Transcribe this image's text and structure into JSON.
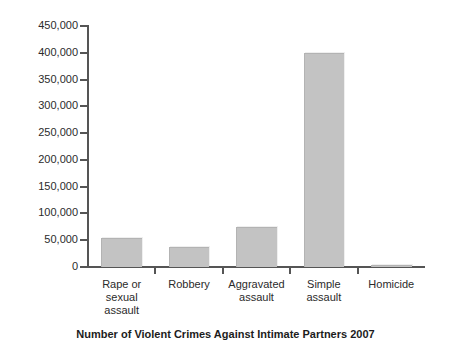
{
  "caption": "Number of Violent Crimes Against Intimate Partners 2007",
  "chart_data": {
    "type": "bar",
    "title": "Number of Violent Crimes Against Intimate Partners 2007",
    "xlabel": "",
    "ylabel": "",
    "ylim": [
      0,
      450000
    ],
    "grid": false,
    "legend": "none",
    "bar_color": "#c3c3c3",
    "axis_color": "#555555",
    "categories": [
      "Rape or sexual assault",
      "Robbery",
      "Aggravated assault",
      "Simple assault",
      "Homicide"
    ],
    "category_lines": [
      [
        "Rape or",
        "sexual",
        "assault"
      ],
      [
        "Robbery"
      ],
      [
        "Aggravated",
        "assault"
      ],
      [
        "Simple",
        "assault"
      ],
      [
        "Homicide"
      ]
    ],
    "values": [
      55000,
      37000,
      75000,
      400000,
      3000
    ],
    "ytick_labels": [
      "450,000",
      "400,000",
      "350,000",
      "300,000",
      "250,000",
      "200,000",
      "150,000",
      "100,000",
      "50,000",
      "0"
    ],
    "ytick_values": [
      450000,
      400000,
      350000,
      300000,
      250000,
      200000,
      150000,
      100000,
      50000,
      0
    ]
  }
}
